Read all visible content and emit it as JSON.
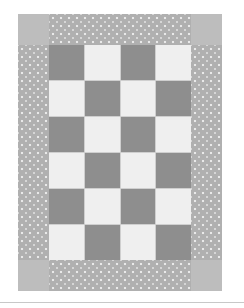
{
  "image": {
    "subject": "checkerboard quilt pattern",
    "grid": {
      "columns": 4,
      "rows": 6
    },
    "colors": {
      "dark_square": "#8e8e8e",
      "light_square": "#efefef",
      "border_print": "#b0b0b0",
      "corner_block": "#bdbdbd"
    }
  }
}
